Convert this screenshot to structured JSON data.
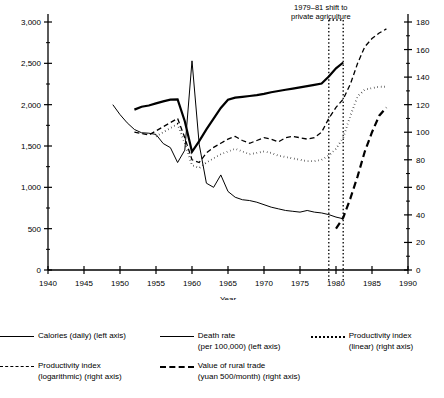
{
  "chart_data": {
    "type": "line",
    "title": "",
    "xlabel": "Year",
    "ylabel_left": "",
    "ylabel_right": "",
    "xlim": [
      1940,
      1990
    ],
    "ylim_left": [
      0,
      3000
    ],
    "ylim_right": [
      0,
      180
    ],
    "grid": false,
    "legend_position": "below",
    "x_ticks": [
      1940,
      1945,
      1950,
      1955,
      1960,
      1965,
      1970,
      1975,
      1980,
      1985,
      1990
    ],
    "y_ticks_left": [
      0,
      500,
      1000,
      1500,
      2000,
      2500,
      3000
    ],
    "y_ticks_left_labels": [
      "0",
      "500",
      "1,000",
      "1,500",
      "2,000",
      "2,500",
      "3,000"
    ],
    "y_ticks_right": [
      0,
      20,
      40,
      60,
      80,
      100,
      120,
      140,
      160,
      180
    ],
    "y_ticks_right_labels": [
      "0",
      "20",
      "40",
      "60",
      "80",
      "100",
      "120",
      "140",
      "160",
      "180"
    ],
    "annotations": [
      {
        "text_line1": "1979–81 shift to",
        "text_line2": "private agriculture",
        "x_start": 1979,
        "x_end": 1981,
        "style": "dotted-vertical-band"
      }
    ],
    "series": [
      {
        "name": "Calories (daily) (left axis)",
        "axis": "left",
        "style": "solid-thick",
        "points": [
          [
            1952,
            1940
          ],
          [
            1953,
            1975
          ],
          [
            1954,
            1990
          ],
          [
            1955,
            2015
          ],
          [
            1956,
            2040
          ],
          [
            1957,
            2060
          ],
          [
            1958,
            2065
          ],
          [
            1959,
            1800
          ],
          [
            1960,
            1430
          ],
          [
            1961,
            1560
          ],
          [
            1962,
            1700
          ],
          [
            1963,
            1830
          ],
          [
            1964,
            1960
          ],
          [
            1965,
            2060
          ],
          [
            1966,
            2085
          ],
          [
            1967,
            2095
          ],
          [
            1968,
            2105
          ],
          [
            1969,
            2115
          ],
          [
            1970,
            2130
          ],
          [
            1971,
            2150
          ],
          [
            1972,
            2165
          ],
          [
            1973,
            2180
          ],
          [
            1974,
            2195
          ],
          [
            1975,
            2210
          ],
          [
            1976,
            2225
          ],
          [
            1977,
            2240
          ],
          [
            1978,
            2255
          ],
          [
            1979,
            2340
          ],
          [
            1980,
            2440
          ],
          [
            1981,
            2510
          ]
        ]
      },
      {
        "name": "Death rate (per 100,000) (left axis)",
        "axis": "left",
        "style": "solid-thin",
        "points": [
          [
            1949,
            2000
          ],
          [
            1950,
            1880
          ],
          [
            1951,
            1780
          ],
          [
            1952,
            1700
          ],
          [
            1953,
            1660
          ],
          [
            1954,
            1655
          ],
          [
            1955,
            1640
          ],
          [
            1956,
            1530
          ],
          [
            1957,
            1480
          ],
          [
            1958,
            1300
          ],
          [
            1959,
            1450
          ],
          [
            1960,
            2530
          ],
          [
            1961,
            1520
          ],
          [
            1962,
            1050
          ],
          [
            1963,
            1000
          ],
          [
            1964,
            1150
          ],
          [
            1965,
            950
          ],
          [
            1966,
            880
          ],
          [
            1967,
            850
          ],
          [
            1968,
            840
          ],
          [
            1969,
            820
          ],
          [
            1970,
            790
          ],
          [
            1971,
            760
          ],
          [
            1972,
            740
          ],
          [
            1973,
            720
          ],
          [
            1974,
            710
          ],
          [
            1975,
            700
          ],
          [
            1976,
            720
          ],
          [
            1977,
            700
          ],
          [
            1978,
            690
          ],
          [
            1979,
            670
          ],
          [
            1980,
            640
          ],
          [
            1981,
            620
          ]
        ]
      },
      {
        "name": "Productivity index (logarithmic) (right axis)",
        "axis": "right",
        "style": "dashed",
        "points": [
          [
            1952,
            100
          ],
          [
            1953,
            99
          ],
          [
            1954,
            98
          ],
          [
            1955,
            101
          ],
          [
            1956,
            104
          ],
          [
            1957,
            107
          ],
          [
            1958,
            110
          ],
          [
            1959,
            96
          ],
          [
            1960,
            80
          ],
          [
            1961,
            78
          ],
          [
            1962,
            85
          ],
          [
            1963,
            89
          ],
          [
            1964,
            92
          ],
          [
            1965,
            95
          ],
          [
            1966,
            97
          ],
          [
            1967,
            94
          ],
          [
            1968,
            92
          ],
          [
            1969,
            94
          ],
          [
            1970,
            96
          ],
          [
            1971,
            95
          ],
          [
            1972,
            93
          ],
          [
            1973,
            96
          ],
          [
            1974,
            97
          ],
          [
            1975,
            96
          ],
          [
            1976,
            95
          ],
          [
            1977,
            96
          ],
          [
            1978,
            100
          ],
          [
            1979,
            110
          ],
          [
            1980,
            118
          ],
          [
            1981,
            124
          ],
          [
            1982,
            135
          ],
          [
            1983,
            150
          ],
          [
            1984,
            162
          ],
          [
            1985,
            168
          ],
          [
            1986,
            172
          ],
          [
            1987,
            175
          ]
        ]
      },
      {
        "name": "Productivity index (linear) (right axis)",
        "axis": "right",
        "style": "dotted",
        "points": [
          [
            1955,
            97
          ],
          [
            1956,
            100
          ],
          [
            1957,
            103
          ],
          [
            1958,
            106
          ],
          [
            1959,
            92
          ],
          [
            1960,
            76
          ],
          [
            1961,
            74
          ],
          [
            1962,
            78
          ],
          [
            1963,
            81
          ],
          [
            1964,
            84
          ],
          [
            1965,
            86
          ],
          [
            1966,
            88
          ],
          [
            1967,
            86
          ],
          [
            1968,
            84
          ],
          [
            1969,
            85
          ],
          [
            1970,
            86
          ],
          [
            1971,
            85
          ],
          [
            1972,
            83
          ],
          [
            1973,
            82
          ],
          [
            1974,
            81
          ],
          [
            1975,
            80
          ],
          [
            1976,
            79
          ],
          [
            1977,
            79
          ],
          [
            1978,
            80
          ],
          [
            1979,
            83
          ],
          [
            1980,
            88
          ],
          [
            1981,
            96
          ],
          [
            1982,
            112
          ],
          [
            1983,
            126
          ],
          [
            1984,
            131
          ],
          [
            1985,
            132
          ],
          [
            1986,
            133
          ],
          [
            1987,
            133
          ]
        ]
      },
      {
        "name": "Value of rural trade (yuan 500/month) (right axis)",
        "axis": "right",
        "style": "long-dash",
        "points": [
          [
            1980,
            30
          ],
          [
            1981,
            38
          ],
          [
            1982,
            52
          ],
          [
            1983,
            68
          ],
          [
            1984,
            86
          ],
          [
            1985,
            100
          ],
          [
            1986,
            112
          ],
          [
            1987,
            118
          ]
        ]
      }
    ]
  },
  "axis": {
    "x_title": "Year"
  },
  "legend": {
    "items": [
      {
        "swatch": "solid",
        "line1": "Calories (daily) (left axis)",
        "line2": ""
      },
      {
        "swatch": "solid",
        "line1": "Death rate",
        "line2": "(per 100,000) (left axis)"
      },
      {
        "swatch": "dotted",
        "line1": "Productivity index",
        "line2": "(linear) (right axis)"
      },
      {
        "swatch": "dashed",
        "line1": "Productivity index",
        "line2": "(logarithmic) (right axis)"
      },
      {
        "swatch": "longdash",
        "line1": "Value of rural trade",
        "line2": "(yuan 500/month) (right axis)"
      }
    ]
  },
  "colors": {
    "ink": "#000000",
    "background": "#ffffff"
  }
}
